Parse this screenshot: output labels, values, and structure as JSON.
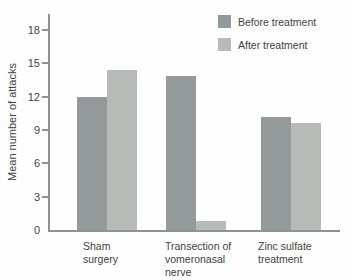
{
  "chart_data": {
    "type": "bar",
    "title": "",
    "xlabel": "",
    "ylabel": "Mean number of attacks",
    "categories": [
      "Sham surgery",
      "Transection of vomeronasal nerve",
      "Zinc sulfate treatment"
    ],
    "category_lines": [
      [
        "Sham",
        "surgery"
      ],
      [
        "Transection of",
        "vomeronasal",
        "nerve"
      ],
      [
        "Zinc sulfate",
        "treatment"
      ]
    ],
    "series": [
      {
        "name": "Before treatment",
        "color": "#949a99",
        "values": [
          12.0,
          13.9,
          10.2
        ]
      },
      {
        "name": "After treatment",
        "color": "#b6bbb8",
        "values": [
          14.4,
          0.8,
          9.6
        ]
      }
    ],
    "yticks": [
      0,
      3,
      6,
      9,
      12,
      15,
      18
    ],
    "ylim": [
      0,
      19.5
    ],
    "grid": false,
    "legend_position": "top-right"
  },
  "colors": {
    "axis": "#8e9392",
    "text": "#3f4443"
  }
}
